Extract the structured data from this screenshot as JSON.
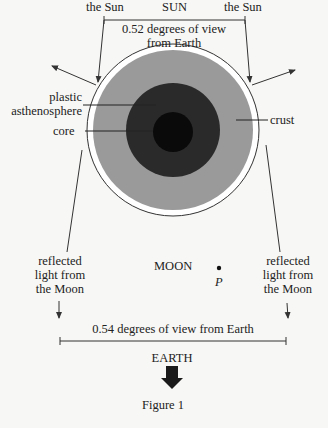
{
  "sun": {
    "title": "SUN",
    "left_edge_label": "the Sun",
    "right_edge_label": "the Sun",
    "angle_line1": "0.52 degrees of view",
    "angle_line2": "from Earth"
  },
  "layers": {
    "asthenosphere_line1": "plastic",
    "asthenosphere_line2": "asthenosphere",
    "core": "core",
    "crust": "crust"
  },
  "moon": {
    "title": "MOON",
    "point_label": "P",
    "reflected_left": [
      "reflected",
      "light from",
      "the Moon"
    ],
    "reflected_right": [
      "reflected",
      "light from",
      "the Moon"
    ],
    "angle": "0.54 degrees of view from Earth"
  },
  "earth": {
    "title": "EARTH"
  },
  "caption": "Figure 1",
  "colors": {
    "background": "#f7f7f5",
    "halo": "#ffffff",
    "crust": "#9a9a9a",
    "asthenosphere": "#2a2a2a",
    "core": "#0a0a0a",
    "line": "#333333"
  }
}
